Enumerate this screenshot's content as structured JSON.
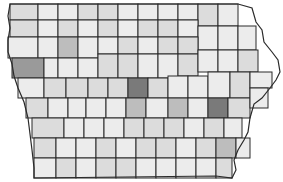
{
  "map": {
    "title": "",
    "region": "Iowa counties",
    "type": "choropleth",
    "shade_colors": {
      "very_light": "#ececec",
      "light": "#dcdcdc",
      "medium": "#bdbdbd",
      "dark": "#9a9a9a",
      "darkest": "#7a7a7a"
    },
    "counties": [
      {
        "row": 0,
        "x": 10,
        "y": 4,
        "w": 28,
        "h": 16,
        "shade": "light"
      },
      {
        "row": 0,
        "x": 38,
        "y": 4,
        "w": 20,
        "h": 16,
        "shade": "very_light"
      },
      {
        "row": 0,
        "x": 58,
        "y": 4,
        "w": 20,
        "h": 16,
        "shade": "very_light"
      },
      {
        "row": 0,
        "x": 78,
        "y": 4,
        "w": 20,
        "h": 16,
        "shade": "light"
      },
      {
        "row": 0,
        "x": 98,
        "y": 4,
        "w": 20,
        "h": 16,
        "shade": "light"
      },
      {
        "row": 0,
        "x": 118,
        "y": 4,
        "w": 20,
        "h": 16,
        "shade": "very_light"
      },
      {
        "row": 0,
        "x": 138,
        "y": 4,
        "w": 20,
        "h": 16,
        "shade": "very_light"
      },
      {
        "row": 0,
        "x": 158,
        "y": 4,
        "w": 20,
        "h": 16,
        "shade": "very_light"
      },
      {
        "row": 0,
        "x": 178,
        "y": 4,
        "w": 20,
        "h": 16,
        "shade": "very_light"
      },
      {
        "row": 0,
        "x": 198,
        "y": 4,
        "w": 20,
        "h": 22,
        "shade": "light"
      },
      {
        "row": 0,
        "x": 218,
        "y": 4,
        "w": 20,
        "h": 22,
        "shade": "very_light"
      },
      {
        "row": 1,
        "x": 10,
        "y": 20,
        "w": 28,
        "h": 17,
        "shade": "light"
      },
      {
        "row": 1,
        "x": 38,
        "y": 20,
        "w": 20,
        "h": 17,
        "shade": "very_light"
      },
      {
        "row": 1,
        "x": 58,
        "y": 20,
        "w": 20,
        "h": 17,
        "shade": "light"
      },
      {
        "row": 1,
        "x": 78,
        "y": 20,
        "w": 20,
        "h": 17,
        "shade": "very_light"
      },
      {
        "row": 1,
        "x": 98,
        "y": 20,
        "w": 20,
        "h": 17,
        "shade": "light"
      },
      {
        "row": 1,
        "x": 118,
        "y": 20,
        "w": 20,
        "h": 17,
        "shade": "very_light"
      },
      {
        "row": 1,
        "x": 138,
        "y": 20,
        "w": 20,
        "h": 17,
        "shade": "light"
      },
      {
        "row": 1,
        "x": 158,
        "y": 20,
        "w": 20,
        "h": 17,
        "shade": "light"
      },
      {
        "row": 1,
        "x": 178,
        "y": 20,
        "w": 20,
        "h": 17,
        "shade": "very_light"
      },
      {
        "row": 1,
        "x": 198,
        "y": 26,
        "w": 20,
        "h": 24,
        "shade": "very_light"
      },
      {
        "row": 1,
        "x": 218,
        "y": 26,
        "w": 20,
        "h": 24,
        "shade": "very_light"
      },
      {
        "row": 2,
        "x": 8,
        "y": 37,
        "w": 30,
        "h": 21,
        "shade": "very_light"
      },
      {
        "row": 2,
        "x": 38,
        "y": 37,
        "w": 20,
        "h": 21,
        "shade": "very_light"
      },
      {
        "row": 2,
        "x": 58,
        "y": 37,
        "w": 20,
        "h": 21,
        "shade": "medium"
      },
      {
        "row": 2,
        "x": 78,
        "y": 37,
        "w": 20,
        "h": 21,
        "shade": "very_light"
      },
      {
        "row": 2,
        "x": 98,
        "y": 37,
        "w": 20,
        "h": 17,
        "shade": "very_light"
      },
      {
        "row": 2,
        "x": 118,
        "y": 37,
        "w": 20,
        "h": 17,
        "shade": "light"
      },
      {
        "row": 2,
        "x": 138,
        "y": 37,
        "w": 20,
        "h": 17,
        "shade": "very_light"
      },
      {
        "row": 2,
        "x": 158,
        "y": 37,
        "w": 20,
        "h": 17,
        "shade": "light"
      },
      {
        "row": 2,
        "x": 178,
        "y": 37,
        "w": 20,
        "h": 17,
        "shade": "light"
      },
      {
        "row": 2,
        "x": 238,
        "y": 26,
        "w": 18,
        "h": 24,
        "shade": "very_light"
      },
      {
        "row": 3,
        "x": 12,
        "y": 58,
        "w": 32,
        "h": 20,
        "shade": "dark"
      },
      {
        "row": 3,
        "x": 44,
        "y": 58,
        "w": 14,
        "h": 20,
        "shade": "very_light"
      },
      {
        "row": 3,
        "x": 58,
        "y": 58,
        "w": 20,
        "h": 20,
        "shade": "very_light"
      },
      {
        "row": 3,
        "x": 78,
        "y": 58,
        "w": 20,
        "h": 20,
        "shade": "very_light"
      },
      {
        "row": 3,
        "x": 98,
        "y": 54,
        "w": 20,
        "h": 24,
        "shade": "light"
      },
      {
        "row": 3,
        "x": 118,
        "y": 54,
        "w": 20,
        "h": 24,
        "shade": "light"
      },
      {
        "row": 3,
        "x": 138,
        "y": 54,
        "w": 20,
        "h": 24,
        "shade": "very_light"
      },
      {
        "row": 3,
        "x": 158,
        "y": 54,
        "w": 20,
        "h": 24,
        "shade": "very_light"
      },
      {
        "row": 3,
        "x": 178,
        "y": 54,
        "w": 20,
        "h": 22,
        "shade": "light"
      },
      {
        "row": 3,
        "x": 198,
        "y": 50,
        "w": 20,
        "h": 22,
        "shade": "very_light"
      },
      {
        "row": 3,
        "x": 218,
        "y": 50,
        "w": 20,
        "h": 22,
        "shade": "very_light"
      },
      {
        "row": 3,
        "x": 238,
        "y": 50,
        "w": 20,
        "h": 22,
        "shade": "light"
      },
      {
        "row": 4,
        "x": 18,
        "y": 78,
        "w": 26,
        "h": 20,
        "shade": "very_light"
      },
      {
        "row": 4,
        "x": 44,
        "y": 78,
        "w": 22,
        "h": 20,
        "shade": "light"
      },
      {
        "row": 4,
        "x": 66,
        "y": 78,
        "w": 22,
        "h": 20,
        "shade": "light"
      },
      {
        "row": 4,
        "x": 88,
        "y": 78,
        "w": 20,
        "h": 20,
        "shade": "light"
      },
      {
        "row": 4,
        "x": 108,
        "y": 78,
        "w": 20,
        "h": 20,
        "shade": "light"
      },
      {
        "row": 4,
        "x": 128,
        "y": 78,
        "w": 20,
        "h": 20,
        "shade": "darkest"
      },
      {
        "row": 4,
        "x": 148,
        "y": 78,
        "w": 20,
        "h": 20,
        "shade": "light"
      },
      {
        "row": 4,
        "x": 168,
        "y": 76,
        "w": 20,
        "h": 22,
        "shade": "very_light"
      },
      {
        "row": 4,
        "x": 188,
        "y": 76,
        "w": 20,
        "h": 22,
        "shade": "very_light"
      },
      {
        "row": 4,
        "x": 208,
        "y": 72,
        "w": 22,
        "h": 26,
        "shade": "very_light"
      },
      {
        "row": 4,
        "x": 230,
        "y": 72,
        "w": 20,
        "h": 26,
        "shade": "light"
      },
      {
        "row": 4,
        "x": 250,
        "y": 72,
        "w": 22,
        "h": 16,
        "shade": "very_light"
      },
      {
        "row": 5,
        "x": 26,
        "y": 98,
        "w": 22,
        "h": 20,
        "shade": "light"
      },
      {
        "row": 5,
        "x": 48,
        "y": 98,
        "w": 20,
        "h": 20,
        "shade": "very_light"
      },
      {
        "row": 5,
        "x": 68,
        "y": 98,
        "w": 18,
        "h": 20,
        "shade": "very_light"
      },
      {
        "row": 5,
        "x": 86,
        "y": 98,
        "w": 20,
        "h": 20,
        "shade": "very_light"
      },
      {
        "row": 5,
        "x": 106,
        "y": 98,
        "w": 20,
        "h": 20,
        "shade": "very_light"
      },
      {
        "row": 5,
        "x": 126,
        "y": 98,
        "w": 20,
        "h": 20,
        "shade": "medium"
      },
      {
        "row": 5,
        "x": 146,
        "y": 98,
        "w": 22,
        "h": 20,
        "shade": "very_light"
      },
      {
        "row": 5,
        "x": 168,
        "y": 98,
        "w": 20,
        "h": 20,
        "shade": "medium"
      },
      {
        "row": 5,
        "x": 188,
        "y": 98,
        "w": 20,
        "h": 20,
        "shade": "very_light"
      },
      {
        "row": 5,
        "x": 208,
        "y": 98,
        "w": 20,
        "h": 20,
        "shade": "darkest"
      },
      {
        "row": 5,
        "x": 228,
        "y": 98,
        "w": 22,
        "h": 20,
        "shade": "light"
      },
      {
        "row": 5,
        "x": 250,
        "y": 88,
        "w": 18,
        "h": 20,
        "shade": "very_light"
      },
      {
        "row": 6,
        "x": 32,
        "y": 118,
        "w": 32,
        "h": 20,
        "shade": "light"
      },
      {
        "row": 6,
        "x": 64,
        "y": 118,
        "w": 20,
        "h": 20,
        "shade": "very_light"
      },
      {
        "row": 6,
        "x": 84,
        "y": 118,
        "w": 20,
        "h": 20,
        "shade": "very_light"
      },
      {
        "row": 6,
        "x": 104,
        "y": 118,
        "w": 20,
        "h": 20,
        "shade": "very_light"
      },
      {
        "row": 6,
        "x": 124,
        "y": 118,
        "w": 20,
        "h": 20,
        "shade": "light"
      },
      {
        "row": 6,
        "x": 144,
        "y": 118,
        "w": 20,
        "h": 20,
        "shade": "light"
      },
      {
        "row": 6,
        "x": 164,
        "y": 118,
        "w": 20,
        "h": 20,
        "shade": "light"
      },
      {
        "row": 6,
        "x": 184,
        "y": 118,
        "w": 20,
        "h": 20,
        "shade": "very_light"
      },
      {
        "row": 6,
        "x": 204,
        "y": 118,
        "w": 20,
        "h": 20,
        "shade": "light"
      },
      {
        "row": 6,
        "x": 224,
        "y": 118,
        "w": 18,
        "h": 20,
        "shade": "very_light"
      },
      {
        "row": 7,
        "x": 34,
        "y": 138,
        "w": 22,
        "h": 20,
        "shade": "light"
      },
      {
        "row": 7,
        "x": 56,
        "y": 138,
        "w": 20,
        "h": 20,
        "shade": "very_light"
      },
      {
        "row": 7,
        "x": 76,
        "y": 138,
        "w": 20,
        "h": 20,
        "shade": "very_light"
      },
      {
        "row": 7,
        "x": 96,
        "y": 138,
        "w": 20,
        "h": 20,
        "shade": "light"
      },
      {
        "row": 7,
        "x": 116,
        "y": 138,
        "w": 20,
        "h": 20,
        "shade": "very_light"
      },
      {
        "row": 7,
        "x": 136,
        "y": 138,
        "w": 20,
        "h": 20,
        "shade": "light"
      },
      {
        "row": 7,
        "x": 156,
        "y": 138,
        "w": 20,
        "h": 20,
        "shade": "light"
      },
      {
        "row": 7,
        "x": 176,
        "y": 138,
        "w": 20,
        "h": 20,
        "shade": "very_light"
      },
      {
        "row": 7,
        "x": 196,
        "y": 138,
        "w": 20,
        "h": 20,
        "shade": "light"
      },
      {
        "row": 7,
        "x": 216,
        "y": 138,
        "w": 20,
        "h": 20,
        "shade": "medium"
      },
      {
        "row": 7,
        "x": 236,
        "y": 138,
        "w": 14,
        "h": 20,
        "shade": "very_light"
      },
      {
        "row": 8,
        "x": 34,
        "y": 158,
        "w": 22,
        "h": 20,
        "shade": "very_light"
      },
      {
        "row": 8,
        "x": 56,
        "y": 158,
        "w": 20,
        "h": 20,
        "shade": "light"
      },
      {
        "row": 8,
        "x": 76,
        "y": 158,
        "w": 20,
        "h": 20,
        "shade": "very_light"
      },
      {
        "row": 8,
        "x": 96,
        "y": 158,
        "w": 20,
        "h": 20,
        "shade": "light"
      },
      {
        "row": 8,
        "x": 116,
        "y": 158,
        "w": 20,
        "h": 20,
        "shade": "light"
      },
      {
        "row": 8,
        "x": 136,
        "y": 158,
        "w": 20,
        "h": 20,
        "shade": "very_light"
      },
      {
        "row": 8,
        "x": 156,
        "y": 158,
        "w": 20,
        "h": 20,
        "shade": "very_light"
      },
      {
        "row": 8,
        "x": 176,
        "y": 158,
        "w": 20,
        "h": 20,
        "shade": "very_light"
      },
      {
        "row": 8,
        "x": 196,
        "y": 158,
        "w": 20,
        "h": 20,
        "shade": "very_light"
      },
      {
        "row": 8,
        "x": 216,
        "y": 158,
        "w": 16,
        "h": 20,
        "shade": "light"
      }
    ]
  }
}
